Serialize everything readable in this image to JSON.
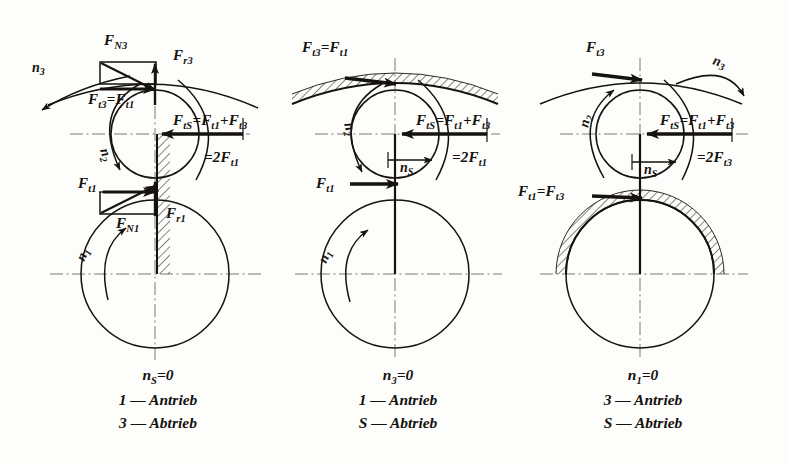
{
  "figure": {
    "title": "",
    "background_color": "#fdfdfb",
    "ink_color": "#15120f",
    "panel_count": 3
  },
  "panels": [
    {
      "id": "panel-1",
      "case_label": "n_S = 0",
      "caption_lines": [
        "nₛ = 0",
        "1 — Antrieb",
        "3 — Abtrieb"
      ],
      "caption": {
        "condition_symbol": "n",
        "condition_sub": "S",
        "condition_value": "= 0",
        "line2_index": "1",
        "line2_dash": "—",
        "line2_word": "Antrieb",
        "line3_index": "3",
        "line3_dash": "—",
        "line3_word": "Abtrieb"
      },
      "fixed_member": "carrier",
      "hatched_element": "carrier-arm",
      "labels": [
        {
          "name": "F_N3",
          "base": "F",
          "sub": "N3",
          "x": 104,
          "y": 42
        },
        {
          "name": "F_r3",
          "base": "F",
          "sub": "r3",
          "x": 172,
          "y": 55
        },
        {
          "name": "F_t3 = F_t1",
          "base": "F",
          "sub": "t3",
          "eq": "=",
          "base2": "F",
          "sub2": "t1",
          "x": 92,
          "y": 92
        },
        {
          "name": "n_3",
          "base": "n",
          "sub": "3",
          "x": 38,
          "y": 70
        },
        {
          "name": "n_2",
          "base": "n",
          "sub": "2",
          "x": 104,
          "y": 148
        },
        {
          "name": "F_tS = F_t1 + F_t3",
          "text": "F_tS = F_t1 + F_t3",
          "x": 180,
          "y": 120
        },
        {
          "name": "= 2F_t1",
          "text": "= 2F_t1",
          "x": 215,
          "y": 157
        },
        {
          "name": "F_t1",
          "base": "F",
          "sub": "t1",
          "x": 82,
          "y": 183
        },
        {
          "name": "F_N1",
          "base": "F",
          "sub": "N1",
          "x": 122,
          "y": 222
        },
        {
          "name": "F_r1",
          "base": "F",
          "sub": "r1",
          "x": 170,
          "y": 212
        },
        {
          "name": "n_1",
          "base": "n",
          "sub": "1",
          "x": 88,
          "y": 258
        }
      ]
    },
    {
      "id": "panel-2",
      "case_label": "n_3 = 0",
      "caption_lines": [
        "n₃ = 0",
        "1 — Antrieb",
        "S — Abtrieb"
      ],
      "caption": {
        "condition_symbol": "n",
        "condition_sub": "3",
        "condition_value": "= 0",
        "line2_index": "1",
        "line2_dash": "—",
        "line2_word": "Antrieb",
        "line3_index": "S",
        "line3_dash": "—",
        "line3_word": "Abtrieb"
      },
      "fixed_member": "ring-gear",
      "hatched_element": "ring-gear-arc",
      "labels": [
        {
          "name": "F_t3 = F_t1",
          "text": "F_t3 = F_t1",
          "x": 300,
          "y": 45
        },
        {
          "name": "n_2",
          "base": "n",
          "sub": "2",
          "x": 348,
          "y": 118
        },
        {
          "name": "F_tS = F_t1 + F_t3",
          "text": "F_tS = F_t1 + F_t3",
          "x": 420,
          "y": 120
        },
        {
          "name": "= 2F_t1",
          "text": "= 2F_t1",
          "x": 463,
          "y": 157
        },
        {
          "name": "n_S",
          "base": "n",
          "sub": "S",
          "x": 411,
          "y": 167
        },
        {
          "name": "F_t1",
          "base": "F",
          "sub": "t1",
          "x": 322,
          "y": 184
        },
        {
          "name": "n_1",
          "base": "n",
          "sub": "1",
          "x": 338,
          "y": 258
        }
      ]
    },
    {
      "id": "panel-3",
      "case_label": "n_1 = 0",
      "caption_lines": [
        "n₁ = 0",
        "3 — Antrieb",
        "S — Abtrieb"
      ],
      "caption": {
        "condition_symbol": "n",
        "condition_sub": "1",
        "condition_value": "= 0",
        "line2_index": "3",
        "line2_dash": "—",
        "line2_word": "Antrieb",
        "line3_index": "S",
        "line3_dash": "—",
        "line3_word": "Abtrieb"
      },
      "fixed_member": "sun-gear",
      "hatched_element": "sun-gear-arc",
      "labels": [
        {
          "name": "F_t3",
          "base": "F",
          "sub": "t3",
          "x": 590,
          "y": 48
        },
        {
          "name": "n_3",
          "base": "n",
          "sub": "3",
          "x": 718,
          "y": 62
        },
        {
          "name": "n_2",
          "base": "n",
          "sub": "2",
          "x": 592,
          "y": 122
        },
        {
          "name": "F_tS = F_t1 + F_t3",
          "text": "F_tS = F_t1 + F_t3",
          "x": 665,
          "y": 120
        },
        {
          "name": "= 2F_t3",
          "text": "= 2F_t3",
          "x": 708,
          "y": 157
        },
        {
          "name": "n_S",
          "base": "n",
          "sub": "S",
          "x": 656,
          "y": 167
        },
        {
          "name": "F_t1 = F_t3",
          "text": "F_t1 = F_t3",
          "x": 524,
          "y": 190
        }
      ]
    }
  ],
  "geometry": {
    "planet_radius": 44,
    "sun_radius": 74,
    "panel_centers_x": [
      155,
      395,
      640
    ],
    "planet_center_y": 134,
    "sun_center_y": 274
  },
  "symbols": {
    "F": "F",
    "n": "n",
    "equals": "=",
    "plus": "+",
    "zero": "0",
    "two": "2"
  }
}
